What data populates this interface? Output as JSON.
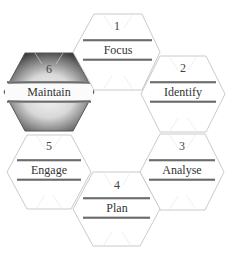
{
  "diagram": {
    "type": "hexagon-cycle",
    "colors": {
      "background": "#ffffff",
      "hex_stroke": "#b8b8b8",
      "band_line": "#7a7a7a",
      "text": "#333333",
      "highlight_dark": "#2e2e2e",
      "highlight_light": "#f4f4f4"
    },
    "steps": [
      {
        "number": "1",
        "label": "Focus",
        "highlighted": false
      },
      {
        "number": "2",
        "label": "Identify",
        "highlighted": false
      },
      {
        "number": "3",
        "label": "Analyse",
        "highlighted": false
      },
      {
        "number": "4",
        "label": "Plan",
        "highlighted": false
      },
      {
        "number": "5",
        "label": "Engage",
        "highlighted": false
      },
      {
        "number": "6",
        "label": "Maintain",
        "highlighted": true
      }
    ]
  }
}
